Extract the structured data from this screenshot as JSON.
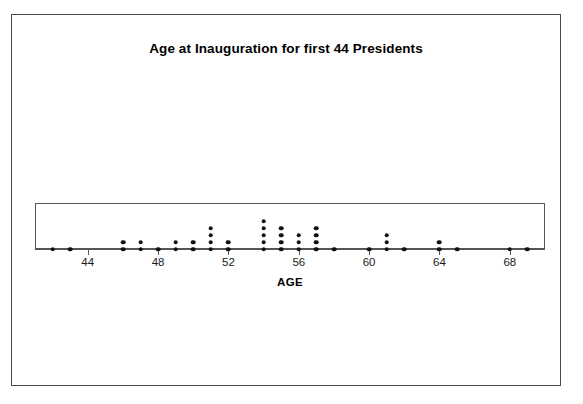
{
  "chart_data": {
    "type": "dotplot",
    "title": "Age at Inauguration for first 44 Presidents",
    "xlabel": "AGE",
    "ylabel": "",
    "xlim": [
      41,
      70
    ],
    "grid": false,
    "legend": null,
    "tick_labels": [
      "44",
      "48",
      "52",
      "56",
      "60",
      "64",
      "68"
    ],
    "tick_values": [
      44,
      48,
      52,
      56,
      60,
      64,
      68
    ],
    "categories": [
      42,
      43,
      46,
      47,
      48,
      49,
      50,
      51,
      52,
      54,
      55,
      56,
      57,
      58,
      60,
      61,
      62,
      64,
      65,
      68,
      69
    ],
    "values": [
      1,
      1,
      2,
      2,
      1,
      2,
      2,
      4,
      2,
      5,
      4,
      3,
      4,
      1,
      1,
      3,
      1,
      2,
      1,
      1,
      1
    ],
    "total_count": 44,
    "dot_color": "#111111",
    "axis_color": "#555555",
    "frame_color": "#4a4a4a"
  }
}
